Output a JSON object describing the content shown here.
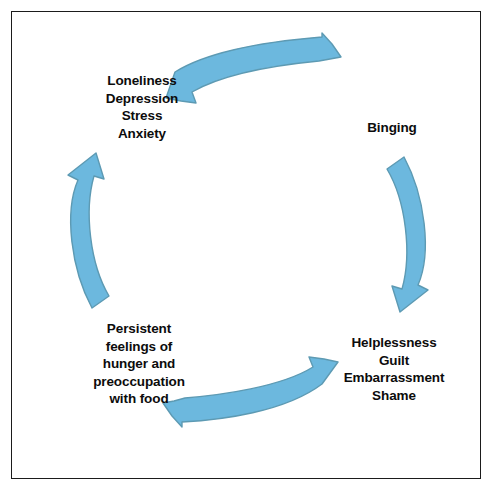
{
  "diagram": {
    "type": "cycle-diagram",
    "direction": "clockwise",
    "arrow_color": "#6cb8de",
    "arrow_stroke_color": "#5d9ab3",
    "text_color": "#0c0c0c",
    "background_color": "#ffffff",
    "border_color": "#1b1b1b",
    "nodes": [
      {
        "id": "binging",
        "position": "right",
        "label": "Binging"
      },
      {
        "id": "negative-self-conscious-emotions",
        "position": "bottom-right",
        "label": "Helplessness\nGuilt\nEmbarrassment\nShame"
      },
      {
        "id": "hunger-preoccupation",
        "position": "bottom-left",
        "label": "Persistent\nfeelings of\nhunger and\npreoccupation\nwith food"
      },
      {
        "id": "mood-states",
        "position": "top-left",
        "label": "Loneliness\nDepression\nStress\nAnxiety"
      }
    ],
    "arrows": [
      {
        "id": "arrow-top",
        "from": "mood-states",
        "to": "binging",
        "points": "right"
      },
      {
        "id": "arrow-right",
        "from": "binging",
        "to": "negative-self-conscious-emotions",
        "points": "down"
      },
      {
        "id": "arrow-bottom",
        "from": "negative-self-conscious-emotions",
        "to": "hunger-preoccupation",
        "points": "left"
      },
      {
        "id": "arrow-left",
        "from": "hunger-preoccupation",
        "to": "mood-states",
        "points": "up"
      }
    ]
  }
}
